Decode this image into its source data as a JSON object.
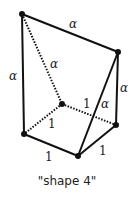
{
  "diagram": {
    "caption": "\"shape 4\"",
    "vertices": {
      "top_left": [
        22,
        14
      ],
      "right_top": [
        118,
        52
      ],
      "back_center": [
        62,
        104
      ],
      "right_bottom": [
        116,
        125
      ],
      "left_bottom": [
        24,
        134
      ],
      "front_bottom": [
        78,
        156
      ]
    },
    "edge_labels": {
      "top_edge": "α",
      "left_edge": "α",
      "diagonal_dotted": "α",
      "right_edge": "α",
      "inner_diagonal": "α",
      "back_right_dotted": "1",
      "back_left_dotted": "1",
      "front_left": "1",
      "front_right": "1"
    },
    "colors": {
      "stroke": "#111111",
      "text": "#222222"
    }
  }
}
